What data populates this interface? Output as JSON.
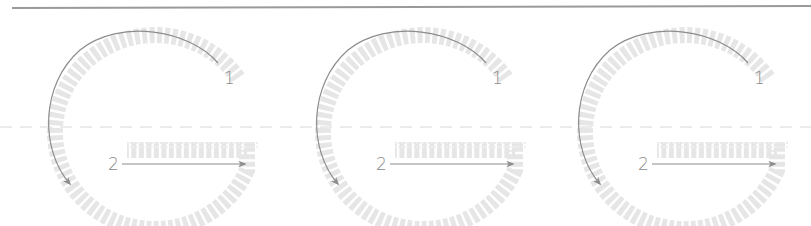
{
  "diagram": {
    "letter": "G",
    "colors": {
      "top_rule": "#9a9a9a",
      "midline": "#d6d6d6",
      "outline": "#e4e4e4",
      "stroke_arrow": "#8c8c8c",
      "label": "#8a8a8a"
    },
    "panels": [
      {
        "offset_x": 0,
        "strokes": [
          {
            "number": "1",
            "description": "curved stroke counter-clockwise from upper right around to lower left"
          },
          {
            "number": "2",
            "description": "horizontal stroke left to right"
          }
        ]
      },
      {
        "offset_x": 268,
        "strokes": [
          {
            "number": "1",
            "description": "curved stroke counter-clockwise from upper right around to lower left"
          },
          {
            "number": "2",
            "description": "horizontal stroke left to right"
          }
        ]
      },
      {
        "offset_x": 530,
        "strokes": [
          {
            "number": "1",
            "description": "curved stroke counter-clockwise from upper right around to lower left"
          },
          {
            "number": "2",
            "description": "horizontal stroke left to right"
          }
        ]
      }
    ]
  }
}
